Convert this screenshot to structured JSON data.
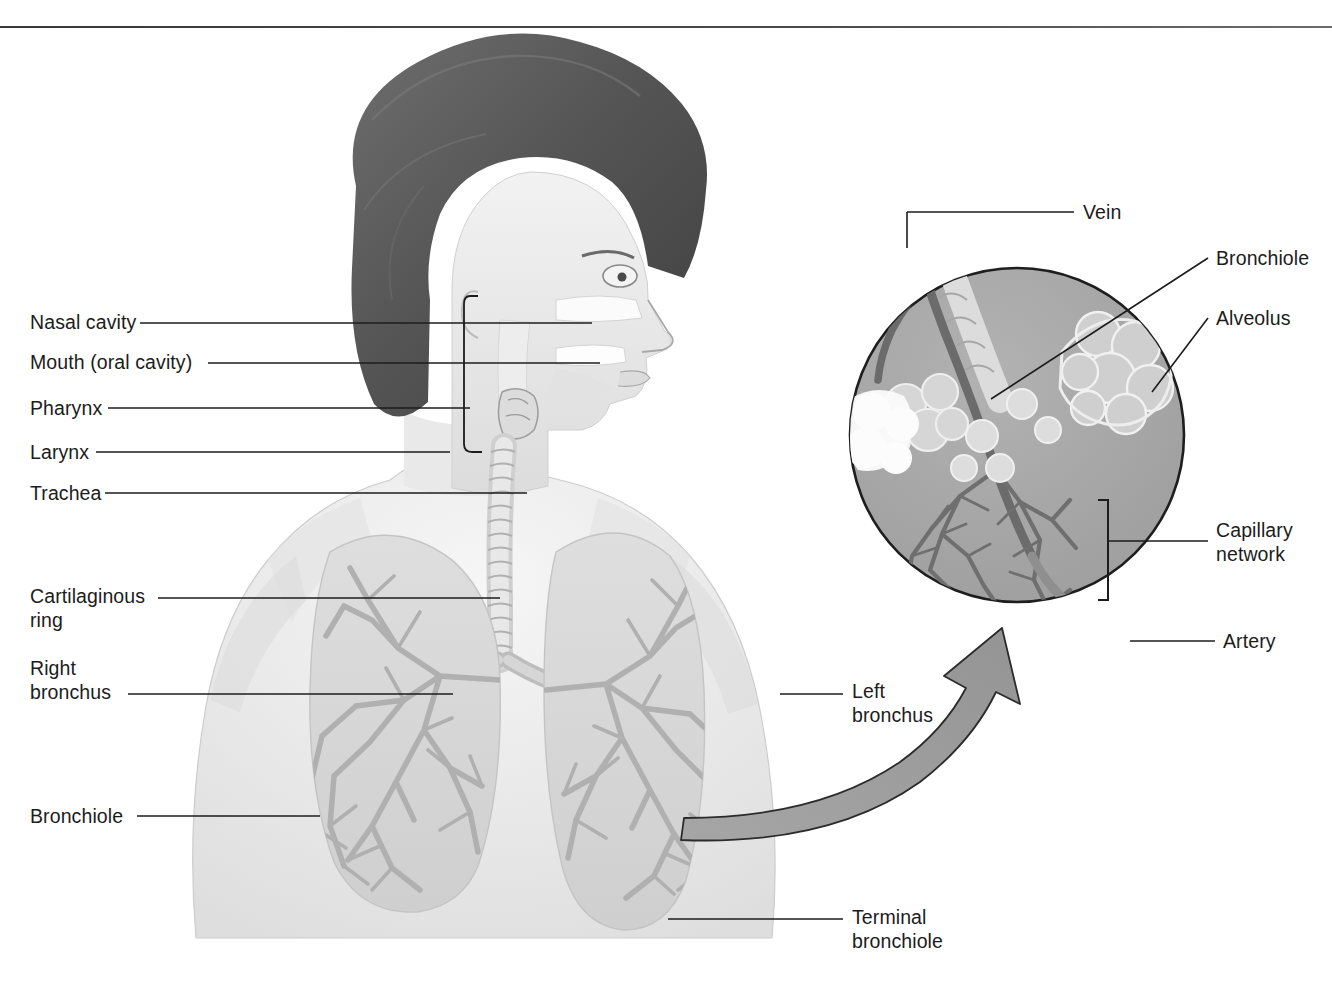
{
  "figure": {
    "background_color": "#ffffff",
    "rule_color": "#4a4a4a"
  },
  "labels_left": [
    {
      "id": "nasal-cavity",
      "text": "Nasal cavity",
      "x": 30,
      "y": 310,
      "leader_x1": 140,
      "leader_y1": 323,
      "leader_x2": 592,
      "leader_y2": 323
    },
    {
      "id": "mouth",
      "text": "Mouth (oral cavity)",
      "x": 30,
      "y": 350,
      "leader_x1": 208,
      "leader_y1": 363,
      "leader_x2": 600,
      "leader_y2": 363
    },
    {
      "id": "pharynx",
      "text": "Pharynx",
      "x": 30,
      "y": 396,
      "leader_x1": 108,
      "leader_y1": 408,
      "leader_x2": 470,
      "leader_y2": 408
    },
    {
      "id": "larynx",
      "text": "Larynx",
      "x": 30,
      "y": 440,
      "leader_x1": 96,
      "leader_y1": 452,
      "leader_x2": 450,
      "leader_y2": 452
    },
    {
      "id": "trachea",
      "text": "Trachea",
      "x": 30,
      "y": 481,
      "leader_x1": 105,
      "leader_y1": 493,
      "leader_x2": 527,
      "leader_y2": 493
    },
    {
      "id": "cartilaginous-ring",
      "text": "Cartilaginous\nring",
      "x": 30,
      "y": 584,
      "leader_x1": 158,
      "leader_y1": 598,
      "leader_x2": 500,
      "leader_y2": 598
    },
    {
      "id": "right-bronchus",
      "text": "Right\nbronchus",
      "x": 30,
      "y": 656,
      "leader_x1": 128,
      "leader_y1": 694,
      "leader_x2": 453,
      "leader_y2": 694
    },
    {
      "id": "bronchiole-lung",
      "text": "Bronchiole",
      "x": 30,
      "y": 804,
      "leader_x1": 137,
      "leader_y1": 816,
      "leader_x2": 320,
      "leader_y2": 816
    }
  ],
  "labels_right": [
    {
      "id": "left-bronchus",
      "text": "Left\nbronchus",
      "x": 852,
      "y": 679,
      "leader_x1": 780,
      "leader_y1": 694,
      "leader_x2": 840,
      "leader_y2": 694
    },
    {
      "id": "terminal-bronchiole",
      "text": "Terminal\nbronchiole",
      "x": 852,
      "y": 905,
      "leader_x1": 668,
      "leader_y1": 919,
      "leader_x2": 840,
      "leader_y2": 919
    }
  ],
  "labels_inset": [
    {
      "id": "vein",
      "text": "Vein",
      "x": 1083,
      "y": 208,
      "leader_x1": 907,
      "leader_y1": 212,
      "leader_x2": 1074,
      "leader_y2": 212
    },
    {
      "id": "bronchiole-inset",
      "text": "Bronchiole",
      "x": 1216,
      "y": 253,
      "leader_x1": 991,
      "leader_y1": 399,
      "leader_x2": 1208,
      "leader_y2": 258
    },
    {
      "id": "alveolus",
      "text": "Alveolus",
      "x": 1216,
      "y": 310,
      "leader_x1": 1152,
      "leader_y1": 392,
      "leader_x2": 1208,
      "leader_y2": 318
    },
    {
      "id": "capillary-network",
      "text": "Capillary\nnetwork",
      "x": 1216,
      "y": 522,
      "leader_x1": 1106,
      "leader_y1": 541,
      "leader_x2": 1208,
      "leader_y2": 541
    },
    {
      "id": "artery",
      "text": "Artery",
      "x": 1223,
      "y": 628,
      "leader_x1": 1130,
      "leader_y1": 641,
      "leader_x2": 1215,
      "leader_y2": 641
    }
  ],
  "inset": {
    "circle": {
      "cx": 1017,
      "cy": 435,
      "r": 168
    },
    "fill_color": "#a8a8a8",
    "stroke_color": "#1e1e1e",
    "vessel_dark": "#6e6e6e",
    "vessel_light": "#8a8a8a",
    "alveoli_color": "#cfcfcf"
  },
  "arrow": {
    "id": "zoom-arrow",
    "fill_color": "#9e9e9e",
    "stroke_color": "#2b2b2b",
    "direction": "from-left-lung-to-inset"
  },
  "body_art": {
    "hair_color": "#5a5a5a",
    "skin_color": "#e8e8e8",
    "lung_color": "#d8d8d8",
    "bronchial_tree_color": "#b4b4b4",
    "trachea_color": "#cccccc"
  }
}
